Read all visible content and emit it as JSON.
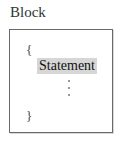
{
  "title": "Block",
  "block": {
    "open_brace": "{",
    "statement": "Statement",
    "close_brace": "}",
    "ellipsis_dots": 3
  }
}
